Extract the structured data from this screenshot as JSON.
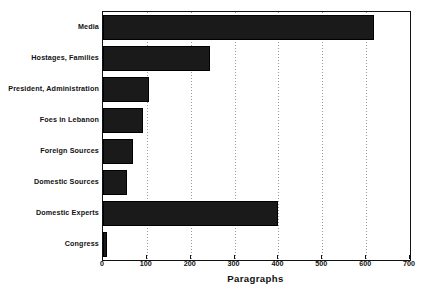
{
  "chart_data": {
    "type": "bar",
    "orientation": "horizontal",
    "title": "",
    "xlabel": "Paragraphs",
    "ylabel": "",
    "xlim": [
      0,
      700
    ],
    "xticks": [
      0,
      100,
      200,
      300,
      400,
      500,
      600,
      700
    ],
    "xtick_labels": [
      "0",
      "100",
      "200",
      "300",
      "400",
      "500",
      "600",
      "700"
    ],
    "grid": true,
    "grid_axis": "x",
    "grid_style": "dotted",
    "legend": null,
    "categories": [
      "Media",
      "Hostages, Families",
      "President, Administration",
      "Foes in Lebanon",
      "Foreign Sources",
      "Domestic Sources",
      "Domestic Experts",
      "Congress"
    ],
    "values": [
      618,
      245,
      105,
      92,
      68,
      55,
      400,
      10
    ],
    "series": [
      {
        "name": "Paragraphs",
        "values": [
          618,
          245,
          105,
          92,
          68,
          55,
          400,
          10
        ]
      }
    ],
    "bar_color": "#1a1a1a",
    "bar_pattern": "dotted-fill",
    "frame_color": "#111111",
    "background_color": "#ffffff"
  }
}
